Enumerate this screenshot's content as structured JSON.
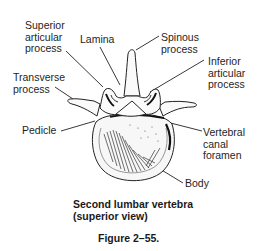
{
  "figure": {
    "subject": "Second lumbar vertebra (superior view)",
    "labels": {
      "superior_articular_process": "Superior\narticular\nprocess",
      "lamina": "Lamina",
      "spinous_process": "Spinous\nprocess",
      "inferior_articular_process": "Inferior\narticular\nprocess",
      "transverse_process": "Transverse\nprocess",
      "pedicle": "Pedicle",
      "vertebral_canal_foramen": "Vertebral\ncanal\nforamen",
      "body": "Body"
    },
    "caption_title": "Second lumbar vertebra\n(superior view)",
    "caption_number": "Figure 2–55."
  }
}
